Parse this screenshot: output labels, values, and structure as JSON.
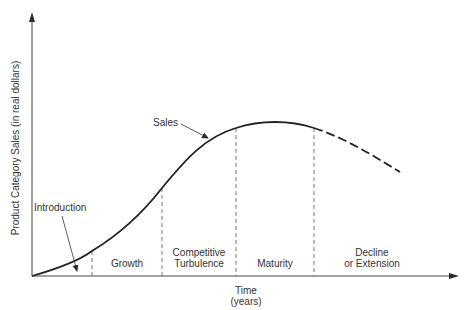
{
  "axes": {
    "y_label": "Product Category Sales (in real dollars)",
    "x_label_line1": "Time",
    "x_label_line2": "(years)"
  },
  "curve": {
    "label": "Sales",
    "declining_segment_style": "dashed"
  },
  "annotation": {
    "introduction": "Introduction"
  },
  "stages": [
    {
      "name": "Introduction",
      "label_lines": []
    },
    {
      "name": "Growth",
      "label_lines": [
        "Growth"
      ]
    },
    {
      "name": "Competitive Turbulence",
      "label_lines": [
        "Competitive",
        "Turbulence"
      ]
    },
    {
      "name": "Maturity",
      "label_lines": [
        "Maturity"
      ]
    },
    {
      "name": "Decline or Extension",
      "label_lines": [
        "Decline",
        "or Extension"
      ]
    }
  ],
  "colors": {
    "ink": "#2a2a2a",
    "background": "#ffffff"
  }
}
